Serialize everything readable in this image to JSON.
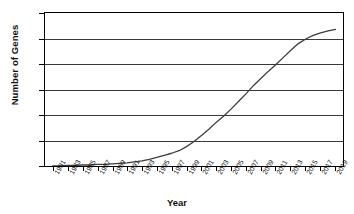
{
  "chart_data": {
    "type": "line",
    "title": "",
    "xlabel": "Year",
    "ylabel": "Number of Genes",
    "xlim": [
      1980,
      2020
    ],
    "ylim": [
      0,
      300
    ],
    "grid": true,
    "legend": "none",
    "ytick_labels": [
      "0",
      "50",
      "100",
      "150",
      "200",
      "250",
      "300"
    ],
    "ytick_values": [
      0,
      50,
      100,
      150,
      200,
      250,
      300
    ],
    "xtick_labels": [
      "1981",
      "1983",
      "1985",
      "1987",
      "1989",
      "1991",
      "1993",
      "1995",
      "1997",
      "1999",
      "2001",
      "2003",
      "2005",
      "2007",
      "2009",
      "2011",
      "2013",
      "2015",
      "2017",
      "2019"
    ],
    "x": [
      1981,
      1982,
      1983,
      1984,
      1985,
      1986,
      1987,
      1988,
      1989,
      1990,
      1991,
      1992,
      1993,
      1994,
      1995,
      1996,
      1997,
      1998,
      1999,
      2000,
      2001,
      2002,
      2003,
      2004,
      2005,
      2006,
      2007,
      2008,
      2009,
      2010,
      2011,
      2012,
      2013,
      2014,
      2015,
      2016,
      2017,
      2018,
      2019
    ],
    "values": [
      0,
      0,
      1,
      1,
      2,
      2,
      3,
      3,
      4,
      5,
      6,
      8,
      10,
      13,
      17,
      21,
      25,
      30,
      38,
      48,
      60,
      72,
      86,
      98,
      112,
      127,
      142,
      158,
      172,
      186,
      199,
      213,
      227,
      240,
      249,
      256,
      261,
      265,
      268
    ],
    "line_color": "#3d3d3d",
    "axis_color": "#000000"
  },
  "axis": {
    "y_title": "Number of Genes",
    "x_title": "Year"
  }
}
